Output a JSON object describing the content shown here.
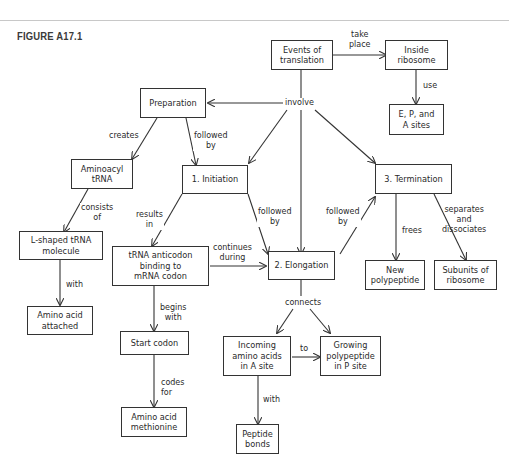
{
  "figure": {
    "title": "FIGURE A17.1"
  },
  "nodes": {
    "events": "Events of\ntranslation",
    "ribosome": "Inside\nribosome",
    "sites": "E, P, and\nA sites",
    "preparation": "Preparation",
    "aminoacyl": "Aminoacyl\ntRNA",
    "lshaped": "L-shaped tRNA\nmolecule",
    "aa_attached": "Amino acid\nattached",
    "initiation": "1. Initiation",
    "anticodon": "tRNA anticodon\nbinding to\nmRNA codon",
    "start_codon": "Start codon",
    "methionine": "Amino acid\nmethionine",
    "elongation": "2. Elongation",
    "incoming": "Incoming\namino acids\nin A site",
    "growing": "Growing\npolypeptide\nin P site",
    "peptide": "Peptide\nbonds",
    "termination": "3. Termination",
    "new_poly": "New\npolypeptide",
    "subunits": "Subunits of\nribosome"
  },
  "links": {
    "take_place": "take\nplace",
    "use": "use",
    "involve": "involve",
    "creates": "creates",
    "followed_by_1": "followed\nby",
    "consists_of": "consists\nof",
    "with_1": "with",
    "results_in": "results\nin",
    "followed_by_2": "followed\nby",
    "followed_by_3": "followed\nby",
    "continues_during": "continues\nduring",
    "begins_with": "begins\nwith",
    "codes_for": "codes\nfor",
    "connects": "connects",
    "to": "to",
    "with_2": "with",
    "frees": "frees",
    "separates": "separates\nand\ndissociates"
  }
}
